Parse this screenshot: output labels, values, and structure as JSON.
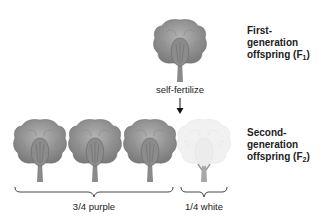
{
  "diagram": {
    "f1": {
      "label_line1": "First-",
      "label_line2": "generation",
      "label_line3_prefix": "offspring (F",
      "label_sub": "1",
      "label_suffix": ")",
      "flower": {
        "type": "purple",
        "fill": "#9a9a9a",
        "shade": "#6f6f6f"
      }
    },
    "process": {
      "label": "self-fertilize",
      "arrow": "down-arrow"
    },
    "f2": {
      "label_line1": "Second-",
      "label_line2": "generation",
      "label_line3_prefix": "offspring (F",
      "label_sub": "2",
      "label_suffix": ")",
      "flowers": [
        {
          "type": "purple",
          "fill": "#9a9a9a",
          "shade": "#6f6f6f"
        },
        {
          "type": "purple",
          "fill": "#9a9a9a",
          "shade": "#6f6f6f"
        },
        {
          "type": "purple",
          "fill": "#9a9a9a",
          "shade": "#6f6f6f"
        },
        {
          "type": "white",
          "fill": "#f0f0f0",
          "shade": "#dcdcdc"
        }
      ]
    },
    "groups": [
      {
        "label": "3/4 purple",
        "count": 3
      },
      {
        "label": "1/4 white",
        "count": 1
      }
    ]
  }
}
